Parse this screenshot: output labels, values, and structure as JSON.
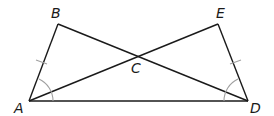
{
  "diagram": {
    "type": "geometry",
    "points": {
      "A": {
        "label": "A",
        "x": 29,
        "y": 101
      },
      "B": {
        "label": "B",
        "x": 58,
        "y": 24
      },
      "C": {
        "label": "C",
        "x": 136,
        "y": 56
      },
      "D": {
        "label": "D",
        "x": 248,
        "y": 101
      },
      "E": {
        "label": "E",
        "x": 218,
        "y": 24
      }
    },
    "segments": [
      "AB",
      "BD",
      "AE",
      "ED",
      "AD"
    ],
    "congruent_marks": [
      "AB",
      "ED"
    ],
    "angle_marks": [
      "BAD",
      "EDA"
    ],
    "colors": {
      "line": "#1a1a1a",
      "mark": "#a0a0a0"
    }
  }
}
